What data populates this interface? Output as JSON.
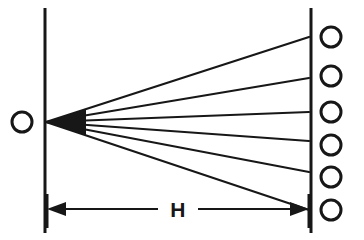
{
  "figure": {
    "background_color": "#ffffff",
    "ink_color": "#171717",
    "width": 364,
    "height": 240
  },
  "source": {
    "label": "O",
    "marker": "open-circle",
    "center_x": 22,
    "center_y": 122,
    "radius": 10,
    "stroke_width": 3
  },
  "left_plane": {
    "name": "source-plane",
    "x": 45,
    "y_top": 8,
    "y_bottom": 233,
    "stroke_width": 3
  },
  "right_plane": {
    "name": "detector-plane",
    "x": 311,
    "y_top": 8,
    "y_bottom": 233,
    "stroke_width": 3
  },
  "apex": {
    "x": 46,
    "y": 122
  },
  "rays": [
    {
      "index": 1,
      "end_x": 309,
      "end_y": 37
    },
    {
      "index": 2,
      "end_x": 309,
      "end_y": 78
    },
    {
      "index": 3,
      "end_x": 309,
      "end_y": 112
    },
    {
      "index": 4,
      "end_x": 309,
      "end_y": 141
    },
    {
      "index": 5,
      "end_x": 309,
      "end_y": 172
    },
    {
      "index": 6,
      "end_x": 309,
      "end_y": 210
    }
  ],
  "detectors": [
    {
      "index": 1,
      "label": "",
      "center_x": 331,
      "center_y": 37,
      "radius": 10
    },
    {
      "index": 2,
      "label": "",
      "center_x": 331,
      "center_y": 76,
      "radius": 10
    },
    {
      "index": 3,
      "label": "",
      "center_x": 331,
      "center_y": 112,
      "radius": 10
    },
    {
      "index": 4,
      "label": "",
      "center_x": 331,
      "center_y": 145,
      "radius": 10
    },
    {
      "index": 5,
      "label": "",
      "center_x": 331,
      "center_y": 177,
      "radius": 10
    },
    {
      "index": 6,
      "label": "",
      "center_x": 331,
      "center_y": 210,
      "radius": 10
    }
  ],
  "dimension": {
    "label": "H",
    "label_x": 178,
    "label_y": 217,
    "line_y": 209,
    "left_x": 47,
    "right_x": 309,
    "left_gap": 158,
    "right_gap": 198,
    "stroke_width": 2,
    "tick_top": 194,
    "tick_bottom": 228
  }
}
